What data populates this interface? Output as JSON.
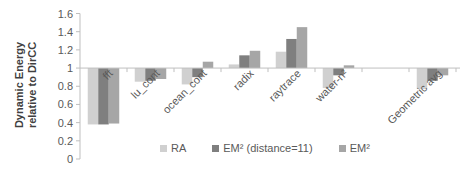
{
  "chart_data": {
    "type": "bar",
    "title": "",
    "xlabel": "",
    "ylabel": "Dynamic Energy relative to DirCC",
    "ylabel_lines": [
      "Dynamic Energy",
      "relative to DirCC"
    ],
    "ylim": [
      0,
      1.6
    ],
    "yticks": [
      "0",
      "0.2",
      "0.4",
      "0.6",
      "0.8",
      "1",
      "1.2",
      "1.4",
      "1.6"
    ],
    "baseline": 1,
    "categories": [
      "fft",
      "lu_cont",
      "ocean_cont",
      "radix",
      "raytrace",
      "water-n²",
      "",
      "Geometric avg"
    ],
    "series": [
      {
        "name": "RA",
        "color": "#d0d0d0",
        "values": [
          0.38,
          0.85,
          0.82,
          1.04,
          1.18,
          0.78,
          null,
          0.77
        ]
      },
      {
        "name": "EM² (distance=11)",
        "color": "#7f7f7f",
        "values": [
          0.38,
          0.86,
          0.9,
          1.14,
          1.32,
          0.92,
          null,
          0.86
        ]
      },
      {
        "name": "EM²",
        "color": "#a6a6a6",
        "values": [
          0.39,
          0.88,
          1.07,
          1.19,
          1.45,
          1.03,
          null,
          0.92
        ]
      }
    ],
    "legend_position": "bottom",
    "grid": false
  }
}
